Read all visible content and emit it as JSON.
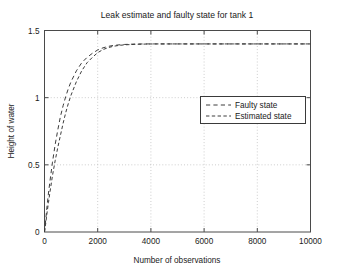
{
  "figure": {
    "background_color": "#ffffff",
    "axes_color": "#4a4a4a",
    "grid_color": "#b8b8b8",
    "line_color": "#3c3c3c"
  },
  "chart_data": {
    "type": "line",
    "title": "Leak estimate and faulty state for tank 1",
    "xlabel": "Number of observations",
    "ylabel": "Height of water",
    "xlim": [
      0,
      10000
    ],
    "ylim": [
      0,
      1.5
    ],
    "xticks": [
      0,
      2000,
      4000,
      6000,
      8000,
      10000
    ],
    "xticklabels": [
      "0",
      "2000",
      "4000",
      "6000",
      "8000",
      "10000"
    ],
    "yticks": [
      0,
      0.5,
      1,
      1.5
    ],
    "yticklabels": [
      "0",
      "0.5",
      "1",
      "1.5"
    ],
    "grid": true,
    "legend_position": "center right",
    "series": [
      {
        "name": "Faulty state",
        "linestyle": "dashed",
        "color": "#3c3c3c",
        "x": [
          0,
          50,
          100,
          150,
          200,
          300,
          400,
          500,
          600,
          700,
          800,
          900,
          1000,
          1200,
          1400,
          1600,
          1800,
          2000,
          2200,
          2400,
          2600,
          2800,
          3000,
          3400,
          3800,
          4200,
          5000,
          6000,
          7000,
          8000,
          9000,
          10000
        ],
        "y": [
          0,
          0.1,
          0.2,
          0.29,
          0.37,
          0.52,
          0.65,
          0.76,
          0.86,
          0.94,
          1.01,
          1.07,
          1.12,
          1.2,
          1.26,
          1.3,
          1.33,
          1.355,
          1.371,
          1.382,
          1.389,
          1.393,
          1.396,
          1.399,
          1.4,
          1.4,
          1.4,
          1.4,
          1.4,
          1.4,
          1.4,
          1.4
        ]
      },
      {
        "name": "Estimated state",
        "linestyle": "dashed",
        "color": "#3c3c3c",
        "x": [
          0,
          50,
          100,
          150,
          200,
          300,
          400,
          500,
          600,
          700,
          800,
          900,
          1000,
          1200,
          1400,
          1600,
          1800,
          2000,
          2200,
          2400,
          2600,
          2800,
          3000,
          3400,
          3800,
          4200,
          5000,
          6000,
          7000,
          8000,
          9000,
          10000
        ],
        "y": [
          0,
          0.07,
          0.15,
          0.22,
          0.29,
          0.42,
          0.53,
          0.63,
          0.72,
          0.81,
          0.89,
          0.96,
          1.02,
          1.12,
          1.2,
          1.26,
          1.3,
          1.335,
          1.358,
          1.373,
          1.383,
          1.389,
          1.393,
          1.397,
          1.399,
          1.4,
          1.4,
          1.4,
          1.4,
          1.4,
          1.4,
          1.4
        ]
      }
    ]
  }
}
